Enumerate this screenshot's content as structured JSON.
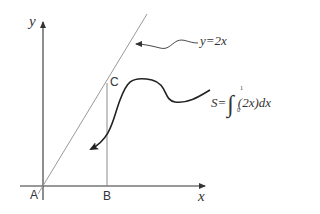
{
  "diagram": {
    "type": "area-under-line",
    "axes": {
      "x_label": "x",
      "y_label": "y"
    },
    "points": {
      "A": "A",
      "B": "B",
      "C": "C"
    },
    "line_label": "y=2x",
    "area_formula": {
      "lhs": "S=",
      "lower_limit": "0",
      "upper_limit": "1",
      "integrand": "(2x)dx"
    },
    "colors": {
      "axis": "#333333",
      "line": "#9a9a9a",
      "vertical": "#8a8a8a",
      "arrow": "#222222",
      "text": "#333333"
    }
  }
}
